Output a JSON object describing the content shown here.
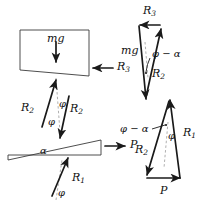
{
  "figure": {
    "ink_color": "#1a1a1a",
    "paper_color": "#ffffff"
  },
  "space_diagram": {
    "block": {
      "name": "upper-block",
      "weight_label": "mg",
      "weight_arrow": "down",
      "reaction_label": "R",
      "reaction_sub": "3",
      "reaction_arrow": "left"
    },
    "wedge": {
      "name": "lower-wedge",
      "angle_label": "α",
      "applied_force_label": "P",
      "applied_force_arrow": "right"
    },
    "interface_forces": [
      {
        "label": "R",
        "sub": "2",
        "angle_label": "φ",
        "direction": "up-left"
      },
      {
        "label": "R",
        "sub": "2",
        "angle_label": "φ",
        "direction": "down-right"
      }
    ],
    "ground_force": {
      "label": "R",
      "sub": "1",
      "angle_label": "φ",
      "direction": "up-right"
    }
  },
  "force_triangles": [
    {
      "name": "block-force-triangle",
      "edges": [
        {
          "label": "R",
          "sub": "3",
          "position": "top",
          "arrow": "left"
        },
        {
          "label": "mg",
          "sub": "",
          "position": "left",
          "arrow": "down"
        },
        {
          "label": "R",
          "sub": "2",
          "position": "diagonal",
          "arrow": "up-right"
        }
      ],
      "angles": [
        "φ − α"
      ]
    },
    {
      "name": "wedge-force-triangle",
      "edges": [
        {
          "label": "R",
          "sub": "1",
          "position": "right",
          "arrow": "up"
        },
        {
          "label": "R",
          "sub": "2",
          "position": "left",
          "arrow": "down-left"
        },
        {
          "label": "P",
          "sub": "",
          "position": "bottom",
          "arrow": "right"
        }
      ],
      "angles": [
        "φ − α",
        "φ"
      ]
    }
  ],
  "labels": {
    "mg_block": "mg",
    "R3_block": "R",
    "R3_block_sub": "3",
    "R2_left": "R",
    "R2_left_sub": "2",
    "R2_right": "R",
    "R2_right_sub": "2",
    "phi_a": "φ",
    "phi_b": "φ",
    "alpha_wedge": "α",
    "P_wedge": "P",
    "R1_ground": "R",
    "R1_ground_sub": "1",
    "phi_ground": "φ",
    "R3_tri": "R",
    "R3_tri_sub": "3",
    "mg_tri": "mg",
    "phi_minus_alpha_top": "φ − α",
    "R2_tri_top": "R",
    "R2_tri_top_sub": "2",
    "phi_minus_alpha_bottom": "φ − α",
    "R1_tri": "R",
    "R1_tri_sub": "1",
    "R2_tri_bottom": "R",
    "R2_tri_bottom_sub": "2",
    "phi_tri": "φ",
    "P_tri": "P"
  }
}
